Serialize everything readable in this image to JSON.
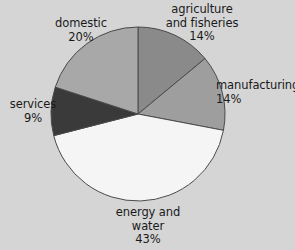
{
  "chart_data": {
    "type": "pie",
    "title": "",
    "subtitle": "",
    "xlabel": "",
    "ylabel": "",
    "legend_position": "none",
    "grid": false,
    "start_angle_deg": 0,
    "direction": "clockwise",
    "units": "percent",
    "categories": [
      "agriculture and fisheries",
      "manufacturing",
      "energy and water",
      "services",
      "domestic"
    ],
    "values": [
      14,
      14,
      43,
      9,
      20
    ],
    "slices": [
      {
        "label_line1": "agriculture",
        "label_line2": "and fisheries",
        "value_text": "14%",
        "value": 14,
        "color": "#8a8a8a"
      },
      {
        "label_line1": "manufacturing",
        "label_line2": "",
        "value_text": "14%",
        "value": 14,
        "color": "#9e9e9e"
      },
      {
        "label_line1": "energy and",
        "label_line2": "water",
        "value_text": "43%",
        "value": 43,
        "color": "#f5f5f5"
      },
      {
        "label_line1": "services",
        "label_line2": "",
        "value_text": "9%",
        "value": 9,
        "color": "#3a3a3a"
      },
      {
        "label_line1": "domestic",
        "label_line2": "",
        "value_text": "20%",
        "value": 20,
        "color": "#a8a8a8"
      }
    ]
  },
  "colors": {
    "background": "#d5d5d5",
    "text": "#1a1a1a",
    "slice_outline": "#4a4a4a"
  }
}
